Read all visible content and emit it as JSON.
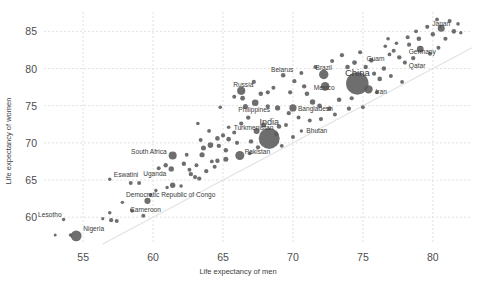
{
  "chart_data": {
    "type": "scatter",
    "title": "",
    "xlabel": "Life expectancy of men",
    "ylabel": "Life expectancy of women",
    "xlim": [
      52.2,
      82.8
    ],
    "ylim": [
      56.4,
      87.6
    ],
    "xticks": [
      55,
      60,
      65,
      70,
      75,
      80
    ],
    "yticks": [
      60,
      65,
      70,
      75,
      80,
      85
    ],
    "grid": true,
    "legend": null,
    "reference_line": {
      "type": "identity",
      "label": "y = x"
    },
    "size_encoding": "population",
    "bubble_color": "#5a5a5a",
    "points": [
      {
        "label": "Lesotho",
        "x": 53.6,
        "y": 59.7,
        "size": 3.4,
        "lx": -2,
        "ly": -5,
        "anchor": "end"
      },
      {
        "label": "",
        "x": 53.0,
        "y": 57.6,
        "size": 3.0
      },
      {
        "label": "",
        "x": 54.1,
        "y": 57.6,
        "size": 3.6
      },
      {
        "label": "Nigeria",
        "x": 54.5,
        "y": 57.5,
        "size": 10.8,
        "lx": 7,
        "ly": -7,
        "anchor": "start"
      },
      {
        "label": "",
        "x": 56.4,
        "y": 59.8,
        "size": 3.2
      },
      {
        "label": "",
        "x": 56.9,
        "y": 60.6,
        "size": 3.6
      },
      {
        "label": "",
        "x": 57.0,
        "y": 59.6,
        "size": 4.2
      },
      {
        "label": "",
        "x": 57.4,
        "y": 59.5,
        "size": 4.0
      },
      {
        "label": "Eswatini",
        "x": 56.9,
        "y": 65.1,
        "size": 3.4,
        "lx": 4,
        "ly": -5,
        "anchor": "start"
      },
      {
        "label": "",
        "x": 58.4,
        "y": 64.6,
        "size": 4.0
      },
      {
        "label": "",
        "x": 59.0,
        "y": 64.6,
        "size": 4.0
      },
      {
        "label": "",
        "x": 58.5,
        "y": 60.9,
        "size": 4.2
      },
      {
        "label": "",
        "x": 59.3,
        "y": 60.2,
        "size": 4.0
      },
      {
        "label": "Cameroon",
        "x": 59.6,
        "y": 62.2,
        "size": 6.2,
        "lx": -2,
        "ly": 9,
        "anchor": "middle"
      },
      {
        "label": "Democratic Republic of Congo",
        "x": 61.4,
        "y": 64.3,
        "size": 5.4,
        "lx": -2,
        "ly": 9,
        "anchor": "middle"
      },
      {
        "label": "South Africa",
        "x": 61.4,
        "y": 68.3,
        "size": 8.0,
        "lx": -6,
        "ly": -4,
        "anchor": "end"
      },
      {
        "label": "Uganda",
        "x": 61.3,
        "y": 66.5,
        "size": 5.4,
        "lx": -5,
        "ly": 5,
        "anchor": "end"
      },
      {
        "label": "",
        "x": 60.9,
        "y": 67.0,
        "size": 4.4
      },
      {
        "label": "",
        "x": 62.2,
        "y": 67.2,
        "size": 4.4
      },
      {
        "label": "",
        "x": 62.6,
        "y": 66.4,
        "size": 4.0
      },
      {
        "label": "",
        "x": 62.7,
        "y": 65.8,
        "size": 4.4
      },
      {
        "label": "",
        "x": 63.0,
        "y": 65.4,
        "size": 4.2
      },
      {
        "label": "",
        "x": 63.3,
        "y": 65.2,
        "size": 4.2
      },
      {
        "label": "",
        "x": 63.1,
        "y": 67.0,
        "size": 4.0
      },
      {
        "label": "",
        "x": 63.5,
        "y": 68.4,
        "size": 5.2
      },
      {
        "label": "",
        "x": 63.6,
        "y": 69.3,
        "size": 5.0
      },
      {
        "label": "",
        "x": 64.1,
        "y": 69.7,
        "size": 5.6
      },
      {
        "label": "",
        "x": 64.6,
        "y": 70.6,
        "size": 4.6
      },
      {
        "label": "",
        "x": 64.7,
        "y": 69.6,
        "size": 4.4
      },
      {
        "label": "",
        "x": 65.2,
        "y": 69.0,
        "size": 4.4
      },
      {
        "label": "",
        "x": 65.0,
        "y": 71.0,
        "size": 4.2
      },
      {
        "label": "",
        "x": 65.4,
        "y": 70.5,
        "size": 4.6
      },
      {
        "label": "Pakistan",
        "x": 66.2,
        "y": 68.3,
        "size": 9.0,
        "lx": 5,
        "ly": -4,
        "anchor": "start"
      },
      {
        "label": "",
        "x": 65.2,
        "y": 67.8,
        "size": 5.0
      },
      {
        "label": "",
        "x": 64.6,
        "y": 67.6,
        "size": 4.4
      },
      {
        "label": "",
        "x": 64.2,
        "y": 67.5,
        "size": 3.8
      },
      {
        "label": "Turkmenistan",
        "x": 65.4,
        "y": 72.1,
        "size": 3.6,
        "lx": 5,
        "ly": 0,
        "anchor": "start"
      },
      {
        "label": "",
        "x": 66.3,
        "y": 72.6,
        "size": 4.2
      },
      {
        "label": "",
        "x": 66.8,
        "y": 73.4,
        "size": 4.4
      },
      {
        "label": "India",
        "x": 68.3,
        "y": 70.6,
        "size": 21.0,
        "lx": 0,
        "ly": -16,
        "anchor": "middle",
        "lsize": 9
      },
      {
        "label": "",
        "x": 67.4,
        "y": 71.6,
        "size": 6.0
      },
      {
        "label": "",
        "x": 67.9,
        "y": 72.4,
        "size": 5.0
      },
      {
        "label": "",
        "x": 69.0,
        "y": 72.2,
        "size": 4.6
      },
      {
        "label": "",
        "x": 69.5,
        "y": 72.4,
        "size": 4.0
      },
      {
        "label": "Bhutan",
        "x": 70.6,
        "y": 71.6,
        "size": 3.4,
        "lx": 5,
        "ly": 0,
        "anchor": "start"
      },
      {
        "label": "Bangladesh",
        "x": 70.0,
        "y": 74.7,
        "size": 7.2,
        "lx": 5,
        "ly": 1,
        "anchor": "start"
      },
      {
        "label": "",
        "x": 68.9,
        "y": 74.7,
        "size": 5.2
      },
      {
        "label": "",
        "x": 68.2,
        "y": 74.9,
        "size": 4.2
      },
      {
        "label": "Philippines",
        "x": 67.3,
        "y": 75.4,
        "size": 6.6,
        "lx": -1,
        "ly": 7,
        "anchor": "middle"
      },
      {
        "label": "",
        "x": 66.6,
        "y": 74.9,
        "size": 5.0
      },
      {
        "label": "",
        "x": 66.4,
        "y": 76.0,
        "size": 4.8
      },
      {
        "label": "Russia",
        "x": 66.3,
        "y": 77.0,
        "size": 8.2,
        "lx": 2,
        "ly": -6,
        "anchor": "middle"
      },
      {
        "label": "",
        "x": 67.7,
        "y": 76.6,
        "size": 4.6
      },
      {
        "label": "",
        "x": 68.2,
        "y": 76.8,
        "size": 4.2
      },
      {
        "label": "Belarus",
        "x": 69.3,
        "y": 79.1,
        "size": 4.6,
        "lx": -1,
        "ly": -5,
        "anchor": "middle"
      },
      {
        "label": "",
        "x": 70.1,
        "y": 78.3,
        "size": 4.2
      },
      {
        "label": "",
        "x": 70.8,
        "y": 77.6,
        "size": 4.4
      },
      {
        "label": "",
        "x": 71.0,
        "y": 76.6,
        "size": 4.6
      },
      {
        "label": "Brazil",
        "x": 72.2,
        "y": 79.2,
        "size": 9.4,
        "lx": 0,
        "ly": -7,
        "anchor": "middle"
      },
      {
        "label": "Mexico",
        "x": 72.3,
        "y": 77.6,
        "size": 8.6,
        "lx": -1,
        "ly": 1,
        "anchor": "middle"
      },
      {
        "label": "",
        "x": 71.4,
        "y": 75.5,
        "size": 5.4
      },
      {
        "label": "",
        "x": 71.9,
        "y": 75.0,
        "size": 4.6
      },
      {
        "label": "",
        "x": 72.6,
        "y": 74.6,
        "size": 4.4
      },
      {
        "label": "",
        "x": 73.3,
        "y": 75.8,
        "size": 4.6
      },
      {
        "label": "China",
        "x": 74.6,
        "y": 78.0,
        "size": 22.5,
        "lx": 0,
        "ly": -11,
        "anchor": "middle",
        "lsize": 9.5
      },
      {
        "label": "Iran",
        "x": 75.4,
        "y": 77.2,
        "size": 8.4,
        "lx": 7,
        "ly": 2,
        "anchor": "start"
      },
      {
        "label": "",
        "x": 73.9,
        "y": 80.2,
        "size": 4.6
      },
      {
        "label": "",
        "x": 74.4,
        "y": 80.8,
        "size": 4.8
      },
      {
        "label": "",
        "x": 75.2,
        "y": 80.2,
        "size": 4.4
      },
      {
        "label": "",
        "x": 75.8,
        "y": 79.3,
        "size": 4.2
      },
      {
        "label": "",
        "x": 76.2,
        "y": 78.6,
        "size": 4.6
      },
      {
        "label": "",
        "x": 76.5,
        "y": 80.0,
        "size": 4.4
      },
      {
        "label": "",
        "x": 75.6,
        "y": 81.1,
        "size": 4.6
      },
      {
        "label": "Guam",
        "x": 76.9,
        "y": 81.9,
        "size": 3.8,
        "lx": -5,
        "ly": 4,
        "anchor": "end"
      },
      {
        "label": "",
        "x": 77.2,
        "y": 82.4,
        "size": 4.0
      },
      {
        "label": "",
        "x": 77.6,
        "y": 81.5,
        "size": 4.4
      },
      {
        "label": "Qatar",
        "x": 78.0,
        "y": 80.8,
        "size": 4.2,
        "lx": 4,
        "ly": 3,
        "anchor": "start"
      },
      {
        "label": "",
        "x": 78.6,
        "y": 81.4,
        "size": 4.4
      },
      {
        "label": "Germany",
        "x": 79.1,
        "y": 82.6,
        "size": 6.8,
        "lx": 2,
        "ly": 3,
        "anchor": "middle"
      },
      {
        "label": "",
        "x": 78.3,
        "y": 83.2,
        "size": 4.2
      },
      {
        "label": "",
        "x": 79.0,
        "y": 84.0,
        "size": 4.6
      },
      {
        "label": "Japan",
        "x": 80.6,
        "y": 85.4,
        "size": 7.0,
        "lx": 0,
        "ly": -5,
        "anchor": "middle"
      },
      {
        "label": "",
        "x": 80.0,
        "y": 84.6,
        "size": 4.4
      },
      {
        "label": "",
        "x": 80.9,
        "y": 84.0,
        "size": 4.2
      },
      {
        "label": "",
        "x": 81.5,
        "y": 85.0,
        "size": 4.6
      },
      {
        "label": "",
        "x": 81.2,
        "y": 86.4,
        "size": 4.0
      },
      {
        "label": "",
        "x": 80.3,
        "y": 86.6,
        "size": 3.8
      },
      {
        "label": "",
        "x": 79.6,
        "y": 85.6,
        "size": 4.2
      },
      {
        "label": "",
        "x": 78.8,
        "y": 85.0,
        "size": 3.8
      },
      {
        "label": "",
        "x": 78.2,
        "y": 84.2,
        "size": 4.0
      },
      {
        "label": "",
        "x": 77.4,
        "y": 83.4,
        "size": 3.6
      },
      {
        "label": "",
        "x": 76.6,
        "y": 83.0,
        "size": 3.6
      },
      {
        "label": "",
        "x": 81.8,
        "y": 86.0,
        "size": 3.6
      },
      {
        "label": "",
        "x": 82.0,
        "y": 84.8,
        "size": 3.4
      },
      {
        "label": "",
        "x": 77.0,
        "y": 79.0,
        "size": 4.0
      },
      {
        "label": "",
        "x": 77.8,
        "y": 78.2,
        "size": 3.8
      },
      {
        "label": "",
        "x": 76.0,
        "y": 76.8,
        "size": 4.0
      },
      {
        "label": "",
        "x": 74.0,
        "y": 74.6,
        "size": 4.2
      },
      {
        "label": "",
        "x": 73.0,
        "y": 73.8,
        "size": 4.0
      },
      {
        "label": "",
        "x": 72.0,
        "y": 73.2,
        "size": 4.2
      },
      {
        "label": "",
        "x": 71.2,
        "y": 73.0,
        "size": 4.0
      },
      {
        "label": "",
        "x": 70.4,
        "y": 73.4,
        "size": 4.0
      },
      {
        "label": "",
        "x": 69.7,
        "y": 74.0,
        "size": 4.2
      },
      {
        "label": "",
        "x": 68.8,
        "y": 71.2,
        "size": 4.4
      },
      {
        "label": "",
        "x": 67.0,
        "y": 70.2,
        "size": 4.4
      },
      {
        "label": "",
        "x": 66.0,
        "y": 70.0,
        "size": 4.2
      },
      {
        "label": "",
        "x": 65.8,
        "y": 71.4,
        "size": 4.0
      },
      {
        "label": "",
        "x": 64.0,
        "y": 71.6,
        "size": 3.8
      },
      {
        "label": "",
        "x": 63.4,
        "y": 70.4,
        "size": 4.0
      },
      {
        "label": "",
        "x": 62.0,
        "y": 64.2,
        "size": 3.6
      },
      {
        "label": "",
        "x": 61.0,
        "y": 64.0,
        "size": 3.4
      },
      {
        "label": "",
        "x": 63.8,
        "y": 66.2,
        "size": 4.2
      },
      {
        "label": "",
        "x": 64.4,
        "y": 66.8,
        "size": 4.0
      },
      {
        "label": "",
        "x": 66.9,
        "y": 68.6,
        "size": 4.0
      },
      {
        "label": "",
        "x": 67.5,
        "y": 69.4,
        "size": 4.2
      },
      {
        "label": "",
        "x": 72.8,
        "y": 81.0,
        "size": 4.0
      },
      {
        "label": "",
        "x": 73.5,
        "y": 81.8,
        "size": 4.2
      },
      {
        "label": "",
        "x": 74.8,
        "y": 82.2,
        "size": 4.0
      },
      {
        "label": "",
        "x": 71.6,
        "y": 80.2,
        "size": 4.0
      },
      {
        "label": "",
        "x": 70.6,
        "y": 79.4,
        "size": 4.0
      },
      {
        "label": "",
        "x": 69.8,
        "y": 76.8,
        "size": 4.2
      },
      {
        "label": "",
        "x": 68.6,
        "y": 77.4,
        "size": 4.0
      },
      {
        "label": "",
        "x": 67.2,
        "y": 78.2,
        "size": 4.2
      },
      {
        "label": "",
        "x": 65.8,
        "y": 76.2,
        "size": 4.0
      },
      {
        "label": "",
        "x": 64.8,
        "y": 74.8,
        "size": 3.6
      },
      {
        "label": "",
        "x": 63.2,
        "y": 72.6,
        "size": 3.6
      },
      {
        "label": "",
        "x": 62.4,
        "y": 68.4,
        "size": 3.8
      },
      {
        "label": "",
        "x": 60.4,
        "y": 66.6,
        "size": 4.0
      },
      {
        "label": "",
        "x": 59.8,
        "y": 63.0,
        "size": 3.6
      },
      {
        "label": "",
        "x": 60.2,
        "y": 63.6,
        "size": 3.4
      },
      {
        "label": "",
        "x": 57.8,
        "y": 62.0,
        "size": 3.4
      },
      {
        "label": "",
        "x": 76.8,
        "y": 84.0,
        "size": 3.6
      },
      {
        "label": "",
        "x": 79.8,
        "y": 82.0,
        "size": 4.0
      },
      {
        "label": "",
        "x": 80.4,
        "y": 82.8,
        "size": 4.0
      },
      {
        "label": "",
        "x": 75.0,
        "y": 74.8,
        "size": 3.8
      },
      {
        "label": "",
        "x": 74.2,
        "y": 76.0,
        "size": 4.2
      },
      {
        "label": "",
        "x": 70.0,
        "y": 70.8,
        "size": 4.0
      },
      {
        "label": "",
        "x": 69.2,
        "y": 69.6,
        "size": 3.8
      }
    ]
  }
}
